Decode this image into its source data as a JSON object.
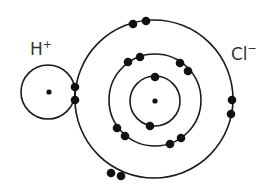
{
  "diagram": {
    "species": [
      {
        "id": "hydrogen",
        "symbol": "H",
        "charge": "+",
        "shells": [
          {
            "name": "shell-1",
            "electrons": 2,
            "shared_with": "chlorine"
          }
        ]
      },
      {
        "id": "chlorine",
        "symbol": "Cl",
        "charge": "−",
        "shells": [
          {
            "name": "shell-1",
            "electrons": 2
          },
          {
            "name": "shell-2",
            "electrons": 8
          },
          {
            "name": "shell-3",
            "electrons": 8
          }
        ]
      }
    ],
    "labels": {
      "h_symbol": "H",
      "h_charge": "+",
      "cl_symbol": "Cl",
      "cl_charge": "−"
    },
    "colors": {
      "line": "#1a1a1a",
      "electron": "#111111",
      "text": "#333333",
      "background": "#ffffff"
    }
  }
}
